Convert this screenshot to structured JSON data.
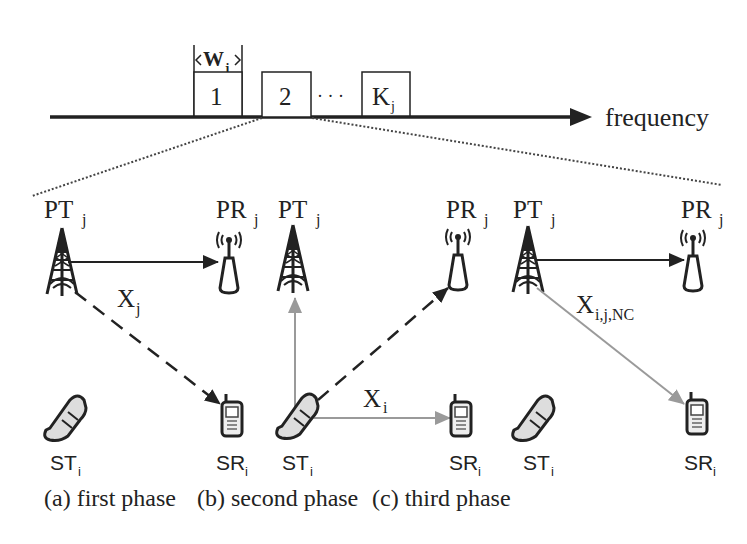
{
  "frequency_axis": {
    "label": "frequency",
    "bandwidth_label": "W",
    "bandwidth_sub": "j",
    "channels": [
      {
        "label": "1",
        "sub": ""
      },
      {
        "label": "2",
        "sub": ""
      },
      {
        "label": "K",
        "sub": "j"
      }
    ],
    "ellipsis": "· · ·"
  },
  "colors": {
    "primary_link": "#222222",
    "secondary_link": "#9a9a9a",
    "dotted_zoom": "#444444"
  },
  "panels": [
    {
      "id": "a",
      "caption": "(a) first phase",
      "pt": {
        "main": "PT",
        "sub": "j"
      },
      "pr": {
        "main": "PR",
        "sub": "j"
      },
      "st": {
        "main": "ST",
        "sub": "i"
      },
      "sr": {
        "main": "SR",
        "sub": "i"
      },
      "signal": {
        "main": "X",
        "sub": "j"
      },
      "links": [
        {
          "from": "PT",
          "to": "PR",
          "style": "solid-dark"
        },
        {
          "from": "PT",
          "to": "SR",
          "style": "dashed-dark"
        }
      ]
    },
    {
      "id": "b",
      "caption": "(b) second phase",
      "pt": {
        "main": "PT",
        "sub": "j"
      },
      "pr": {
        "main": "PR",
        "sub": "j"
      },
      "st": {
        "main": "ST",
        "sub": "i"
      },
      "sr": {
        "main": "SR",
        "sub": "i"
      },
      "signal": {
        "main": "X",
        "sub": "i"
      },
      "links": [
        {
          "from": "ST",
          "to": "PT",
          "style": "solid-gray"
        },
        {
          "from": "ST",
          "to": "PR",
          "style": "dashed-dark"
        },
        {
          "from": "ST",
          "to": "SR",
          "style": "solid-gray"
        }
      ]
    },
    {
      "id": "c",
      "caption": "(c) third phase",
      "pt": {
        "main": "PT",
        "sub": "j"
      },
      "pr": {
        "main": "PR",
        "sub": "j"
      },
      "st": {
        "main": "ST",
        "sub": "i"
      },
      "sr": {
        "main": "SR",
        "sub": "i"
      },
      "signal": {
        "main": "X",
        "sub": "i,j,NC"
      },
      "links": [
        {
          "from": "PT",
          "to": "PR",
          "style": "solid-dark"
        },
        {
          "from": "PT",
          "to": "SR",
          "style": "solid-gray"
        }
      ]
    }
  ],
  "icons": {
    "pt": "transmitter-tower-icon",
    "pr": "receiver-antenna-icon",
    "st": "flip-phone-icon",
    "sr": "mobile-phone-icon"
  }
}
